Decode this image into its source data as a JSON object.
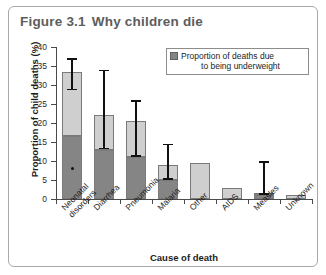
{
  "figure": {
    "number": "Figure 3.1",
    "title": "Why children die"
  },
  "legend": {
    "swatch_color": "#858585",
    "line1": "Proportion of deaths due",
    "line2": "to being underweight",
    "full_text": "Proportion of deaths due to being underweight"
  },
  "colors": {
    "total_bar": "#cfcfcf",
    "underweight_bar": "#858585",
    "axis": "#4a4a4a",
    "error_bar": "#111111",
    "title_text": "#5d5d5d",
    "frame": "#a9a9a9"
  },
  "chart_data": {
    "type": "bar",
    "xlabel": "Cause of death",
    "ylabel": "Proportion of child deaths (%)",
    "ylim": [
      0,
      40
    ],
    "yticks": [
      0,
      5,
      10,
      15,
      20,
      25,
      30,
      35,
      40
    ],
    "ytick_labels": [
      "0",
      "5",
      "10",
      "15",
      "20",
      "25",
      "30",
      "35",
      "40"
    ],
    "grid": false,
    "legend_position": "top-right",
    "stacked": true,
    "categories": [
      "Neonatal disorders",
      "Diarrhea",
      "Pneumonia",
      "Malaria",
      "Other",
      "AIDS",
      "Measles",
      "Unknown"
    ],
    "category_label_lines": [
      [
        "Neonatal",
        "disorders"
      ],
      [
        "Diarrhea"
      ],
      [
        "Pneumonia"
      ],
      [
        "Malaria"
      ],
      [
        "Other"
      ],
      [
        "AIDS"
      ],
      [
        "Measles"
      ],
      [
        "Unknown"
      ]
    ],
    "series": [
      {
        "name": "Proportion of child deaths (total)",
        "color": "#cfcfcf",
        "values": [
          33.5,
          22.0,
          20.5,
          9.0,
          9.5,
          3.0,
          1.5,
          1.0
        ]
      },
      {
        "name": "Proportion of deaths due to being underweight",
        "color": "#858585",
        "values": [
          16.5,
          13.0,
          11.0,
          5.0,
          null,
          null,
          1.0,
          null
        ]
      }
    ],
    "error_bars": [
      {
        "category": "Neonatal disorders",
        "low": 29.0,
        "high": 37.0
      },
      {
        "category": "Diarrhea",
        "low": 13.5,
        "high": 34.0
      },
      {
        "category": "Pneumonia",
        "low": 11.5,
        "high": 26.0
      },
      {
        "category": "Malaria",
        "low": 5.5,
        "high": 14.5
      },
      {
        "category": "Other",
        "low": null,
        "high": null
      },
      {
        "category": "AIDS",
        "low": null,
        "high": null
      },
      {
        "category": "Measles",
        "low": 1.5,
        "high": 10.0
      },
      {
        "category": "Unknown",
        "low": null,
        "high": null
      }
    ],
    "point_markers": [
      {
        "category": "Neonatal disorders",
        "value": 8.0
      }
    ]
  }
}
